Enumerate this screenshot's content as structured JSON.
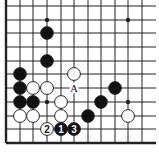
{
  "board": {
    "description": "Go problem diagram (lower-left corner section)",
    "grid": {
      "x_lines": [
        6,
        20,
        33,
        47,
        61,
        74,
        88,
        101,
        115,
        128,
        142
      ],
      "y_lines": [
        6,
        20,
        33,
        47,
        61,
        74,
        88,
        102,
        116,
        129,
        143
      ],
      "right_extent": 156,
      "top_extent": 0,
      "left_edge_thick": true,
      "bottom_edge_thick": true,
      "line_color": "#222222"
    },
    "star_points": [
      {
        "x": 47,
        "y": 20
      },
      {
        "x": 128,
        "y": 20
      },
      {
        "x": 47,
        "y": 102
      },
      {
        "x": 128,
        "y": 102
      }
    ],
    "black_stones": [
      {
        "x": 47,
        "y": 33
      },
      {
        "x": 47,
        "y": 61
      },
      {
        "x": 20,
        "y": 74
      },
      {
        "x": 20,
        "y": 88
      },
      {
        "x": 20,
        "y": 102
      },
      {
        "x": 33,
        "y": 102
      },
      {
        "x": 115,
        "y": 88
      },
      {
        "x": 101,
        "y": 102
      },
      {
        "x": 88,
        "y": 116
      }
    ],
    "white_stones": [
      {
        "x": 74,
        "y": 74
      },
      {
        "x": 33,
        "y": 88
      },
      {
        "x": 47,
        "y": 88
      },
      {
        "x": 61,
        "y": 102
      },
      {
        "x": 20,
        "y": 116
      },
      {
        "x": 33,
        "y": 116
      },
      {
        "x": 61,
        "y": 116
      },
      {
        "x": 128,
        "y": 116
      }
    ],
    "numbered_moves": [
      {
        "x": 61,
        "y": 129,
        "color": "black",
        "label": "1"
      },
      {
        "x": 47,
        "y": 129,
        "color": "white",
        "label": "2"
      },
      {
        "x": 74,
        "y": 129,
        "color": "black",
        "label": "3"
      }
    ],
    "labels": [
      {
        "x": 74,
        "y": 88,
        "text": "A"
      }
    ],
    "colors": {
      "black_stone": "#111111",
      "white_stone": "#ffffff",
      "stone_outline": "#222222",
      "background": "#ffffff"
    }
  }
}
